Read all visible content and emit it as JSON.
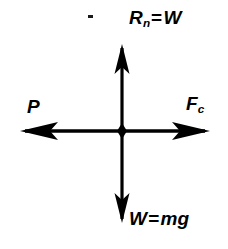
{
  "diagram": {
    "background_color": "#ffffff",
    "stroke_color": "#000000",
    "origin": {
      "x": 122,
      "y": 131
    },
    "labels": {
      "normal_reaction": {
        "base": "R",
        "subscript": "n",
        "equals": "=",
        "value": "W",
        "full": "Rn = W"
      },
      "weight": {
        "base": "W",
        "subscript": "",
        "equals": "=",
        "value": "mg",
        "full": "W = mg"
      },
      "push": {
        "base": "P",
        "subscript": "",
        "equals": "",
        "value": "",
        "full": "P"
      },
      "centripetal": {
        "base": "F",
        "subscript": "c",
        "equals": "",
        "value": "",
        "full": "Fc"
      }
    },
    "arrows": [
      {
        "name": "normal-reaction-arrow",
        "direction": "up",
        "from_x": 122,
        "from_y": 131,
        "to_x": 122,
        "to_y": 45,
        "label": "Rn = W"
      },
      {
        "name": "weight-arrow",
        "direction": "down",
        "from_x": 122,
        "from_y": 131,
        "to_x": 122,
        "to_y": 222,
        "label": "W = mg"
      },
      {
        "name": "push-arrow",
        "direction": "left",
        "from_x": 122,
        "from_y": 131,
        "to_x": 21,
        "to_y": 131,
        "label": "P"
      },
      {
        "name": "centripetal-arrow",
        "direction": "right",
        "from_x": 122,
        "from_y": 131,
        "to_x": 209,
        "to_y": 131,
        "label": "Fc"
      }
    ]
  }
}
